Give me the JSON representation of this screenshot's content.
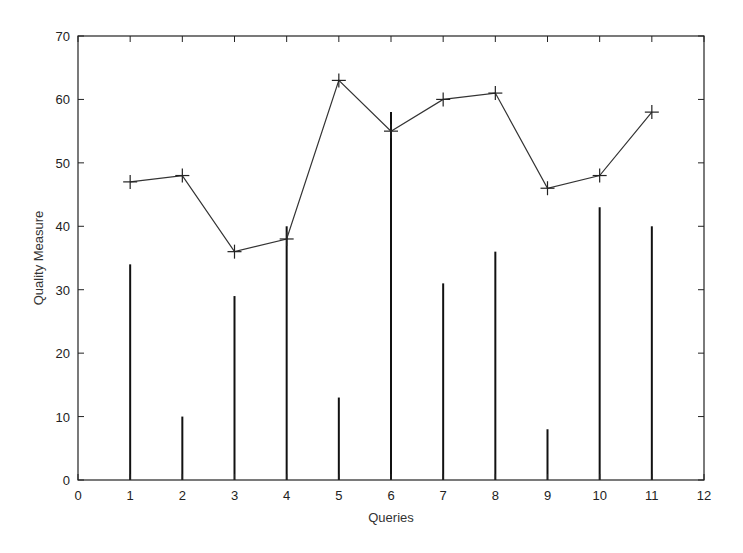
{
  "chart_data": {
    "type": "line+impulse",
    "title": "",
    "xlabel": "Queries",
    "ylabel": "Quality Measure",
    "xlim": [
      0,
      12
    ],
    "ylim": [
      0,
      70
    ],
    "x_ticks": [
      0,
      1,
      2,
      3,
      4,
      5,
      6,
      7,
      8,
      9,
      10,
      11,
      12
    ],
    "y_ticks": [
      0,
      10,
      20,
      30,
      40,
      50,
      60,
      70
    ],
    "grid": false,
    "legend": null,
    "x": [
      1,
      2,
      3,
      4,
      5,
      6,
      7,
      8,
      9,
      10,
      11
    ],
    "series": [
      {
        "name": "line",
        "type": "line",
        "marker": "+",
        "values": [
          47,
          48,
          36,
          38,
          63,
          55,
          60,
          61,
          46,
          48,
          58
        ]
      },
      {
        "name": "impulses",
        "type": "bar",
        "style": "impulse",
        "values": [
          34,
          10,
          29,
          40,
          13,
          58,
          31,
          36,
          8,
          43,
          40
        ]
      }
    ]
  },
  "colors": {
    "line": "#333333",
    "impulse": "#111111",
    "axis": "#222222"
  }
}
